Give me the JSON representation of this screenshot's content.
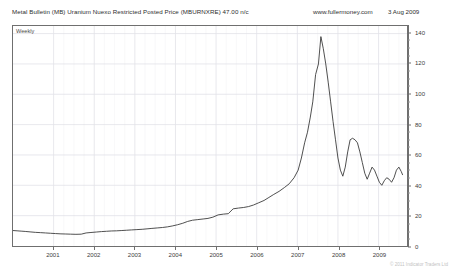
{
  "header": {
    "title": "Metal Bulletin (MB) Uranium Nuexo Restricted Posted Price (MBURNXRE) 47.00 n/c",
    "website": "www.fullermoney.com",
    "date": "3 Aug 2009"
  },
  "footer": {
    "copyright": "© 2011 Indicator Traders Ltd"
  },
  "colors": {
    "line": "#3a3a3a",
    "frame": "#6f6f6f",
    "grid": "#e2e2e8",
    "text": "#2e2e2e",
    "background": "#ffffff"
  },
  "chart_data": {
    "type": "line",
    "title": "Metal Bulletin (MB) Uranium Nuexo Restricted Posted Price (MBURNXRE) 47.00 n/c",
    "subtitle": "Weekly",
    "frequency_label": "Weekly",
    "xlabel": "",
    "ylabel": "",
    "ylim": [
      0,
      145
    ],
    "xlim": [
      2000.0,
      2009.7
    ],
    "grid": true,
    "legend": null,
    "y_axis_position": "right",
    "yticks": [
      0,
      20,
      40,
      60,
      80,
      100,
      120,
      140
    ],
    "ytick_labels": [
      "0",
      "20",
      "40",
      "60",
      "80",
      "100",
      "120",
      "140"
    ],
    "xticks": [
      2001,
      2002,
      2003,
      2004,
      2005,
      2006,
      2007,
      2008,
      2009
    ],
    "xtick_labels": [
      "2001",
      "2002",
      "2003",
      "2004",
      "2005",
      "2006",
      "2007",
      "2008",
      "2009"
    ],
    "last_value": 47.0,
    "change": "n/c",
    "peak_value": 138,
    "peak_x": 2007.45,
    "series": [
      {
        "name": "MBURNXRE",
        "x": [
          2000.0,
          2000.1,
          2000.2,
          2000.3,
          2000.42,
          2000.55,
          2000.68,
          2000.8,
          2000.92,
          2001.05,
          2001.18,
          2001.3,
          2001.42,
          2001.55,
          2001.68,
          2001.8,
          2001.92,
          2002.05,
          2002.18,
          2002.3,
          2002.42,
          2002.55,
          2002.68,
          2002.8,
          2002.92,
          2003.05,
          2003.18,
          2003.3,
          2003.42,
          2003.55,
          2003.68,
          2003.8,
          2003.92,
          2004.05,
          2004.18,
          2004.3,
          2004.42,
          2004.55,
          2004.68,
          2004.8,
          2004.92,
          2005.05,
          2005.18,
          2005.3,
          2005.42,
          2005.55,
          2005.68,
          2005.8,
          2005.92,
          2006.05,
          2006.18,
          2006.3,
          2006.42,
          2006.55,
          2006.68,
          2006.8,
          2006.92,
          2007.02,
          2007.1,
          2007.18,
          2007.25,
          2007.32,
          2007.38,
          2007.45,
          2007.52,
          2007.58,
          2007.64,
          2007.7,
          2007.76,
          2007.82,
          2007.88,
          2007.94,
          2008.0,
          2008.06,
          2008.12,
          2008.18,
          2008.24,
          2008.3,
          2008.36,
          2008.42,
          2008.48,
          2008.54,
          2008.6,
          2008.66,
          2008.72,
          2008.78,
          2008.84,
          2008.9,
          2008.96,
          2009.02,
          2009.08,
          2009.14,
          2009.2,
          2009.26,
          2009.32,
          2009.38,
          2009.44,
          2009.5,
          2009.56,
          2009.59
        ],
        "y": [
          10.2,
          10.0,
          9.8,
          9.6,
          9.3,
          9.0,
          8.8,
          8.6,
          8.4,
          8.2,
          8.0,
          7.9,
          7.8,
          7.7,
          7.8,
          8.6,
          8.9,
          9.2,
          9.5,
          9.7,
          9.9,
          10.0,
          10.2,
          10.4,
          10.6,
          10.8,
          11.0,
          11.3,
          11.6,
          11.9,
          12.2,
          12.6,
          13.2,
          14.0,
          15.0,
          16.2,
          17.0,
          17.4,
          17.8,
          18.2,
          19.0,
          20.5,
          21.0,
          21.3,
          24.5,
          25.0,
          25.4,
          26.0,
          27.0,
          28.5,
          30.0,
          32.0,
          34.0,
          36.0,
          38.5,
          41.0,
          45.0,
          50.0,
          58.0,
          68.0,
          75.0,
          85.0,
          95.0,
          113.0,
          120.0,
          138.0,
          130.0,
          120.0,
          108.0,
          95.0,
          82.0,
          70.0,
          58.0,
          50.0,
          46.0,
          52.0,
          62.0,
          70.0,
          71.0,
          70.0,
          68.0,
          62.0,
          55.0,
          48.0,
          44.0,
          48.0,
          52.0,
          50.0,
          46.0,
          42.0,
          40.0,
          43.0,
          45.0,
          44.0,
          42.0,
          45.0,
          50.0,
          52.0,
          49.0,
          47.0
        ]
      }
    ]
  }
}
